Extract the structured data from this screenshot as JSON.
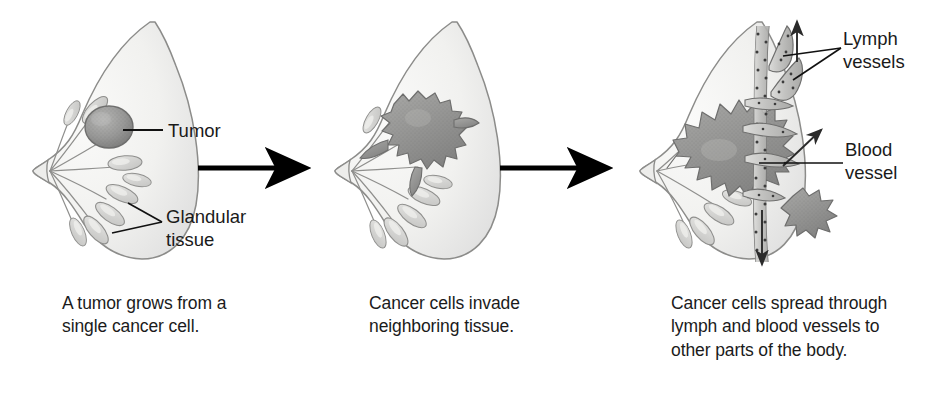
{
  "figure": {
    "background_color": "#ffffff",
    "panel_count": 3
  },
  "palette": {
    "breast_fill": "#f2f2f0",
    "breast_fill_shadow": "#dcdcda",
    "breast_outline": "#8c8c8a",
    "gland_fill": "#d8d8d6",
    "gland_outline": "#8f8f8d",
    "tumor_fill": "#9a9a99",
    "tumor_outline": "#6e6e6d",
    "vessel_fill": "#c9c9c7",
    "vessel_outline": "#6f6f6e",
    "vessel_dots": "#3c3c3c",
    "arrow_black": "#000000",
    "leader_line": "#111111",
    "text": "#1b1b1b"
  },
  "panels": [
    {
      "id": "panel-1",
      "stage": 1,
      "caption": "A tumor grows from a\nsingle cancer cell.",
      "labels": [
        {
          "id": "tumor",
          "text": "Tumor",
          "x": 168,
          "y": 123
        },
        {
          "id": "glandular-tissue",
          "text": "Glandular\ntissue",
          "x": 166,
          "y": 208
        }
      ],
      "features": [
        "breast-outline",
        "nipple",
        "glandular-lobules",
        "single-tumor-mass"
      ]
    },
    {
      "id": "panel-2",
      "stage": 2,
      "caption": "Cancer cells invade\nneighboring tissue.",
      "labels": [],
      "features": [
        "breast-outline",
        "nipple",
        "glandular-lobules",
        "invasive-tumor-mass"
      ]
    },
    {
      "id": "panel-3",
      "stage": 3,
      "caption": "Cancer cells spread through\nlymph and blood vessels to\nother parts of the body.",
      "labels": [
        {
          "id": "lymph-vessels",
          "text": "Lymph\nvessels",
          "x": 843,
          "y": 30
        },
        {
          "id": "blood-vessel",
          "text": "Blood\nvessel",
          "x": 845,
          "y": 140
        }
      ],
      "features": [
        "breast-outline",
        "nipple",
        "glandular-lobules",
        "large-invasive-tumor-mass",
        "vertical-blood-vessel",
        "lymph-vessel-branches",
        "metastatic-cell-cluster",
        "flow-arrow-up",
        "flow-arrow-down",
        "flow-arrow-diagonal"
      ]
    }
  ],
  "arrows": [
    {
      "id": "progression-arrow-1",
      "from_panel": 1,
      "to_panel": 2,
      "x1": 198,
      "y1": 168,
      "x2": 305,
      "y2": 168,
      "direction": "right"
    },
    {
      "id": "progression-arrow-2",
      "from_panel": 2,
      "to_panel": 3,
      "x1": 500,
      "y1": 168,
      "x2": 607,
      "y2": 168,
      "direction": "right"
    }
  ],
  "icons": {
    "arrow_right": "arrow-right-icon",
    "arrow_up": "arrow-up-icon",
    "arrow_down": "arrow-down-icon",
    "arrow_diagonal": "arrow-diagonal-icon"
  }
}
